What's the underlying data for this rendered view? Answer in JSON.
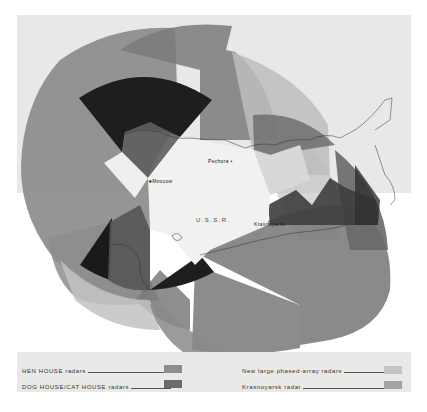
{
  "map": {
    "region_label": "U.S.S.R.",
    "cities": [
      {
        "name": "Moscow",
        "marker": "star-icon"
      },
      {
        "name": "Pechora",
        "marker": "dot"
      },
      {
        "name": "Krasnoyarsk",
        "marker": "dot"
      }
    ],
    "background_color": "#e9e9e7"
  },
  "legend": {
    "items": [
      {
        "label": "HEN HOUSE radars",
        "color": "#8e8e8e"
      },
      {
        "label": "DOG HOUSE/CAT HOUSE radars",
        "color": "#6b6b6b"
      },
      {
        "label": "New large phased-array radars",
        "color": "#c4c4c4"
      },
      {
        "label": "Krasnoyarsk radar",
        "color": "#a2a2a2"
      }
    ]
  }
}
